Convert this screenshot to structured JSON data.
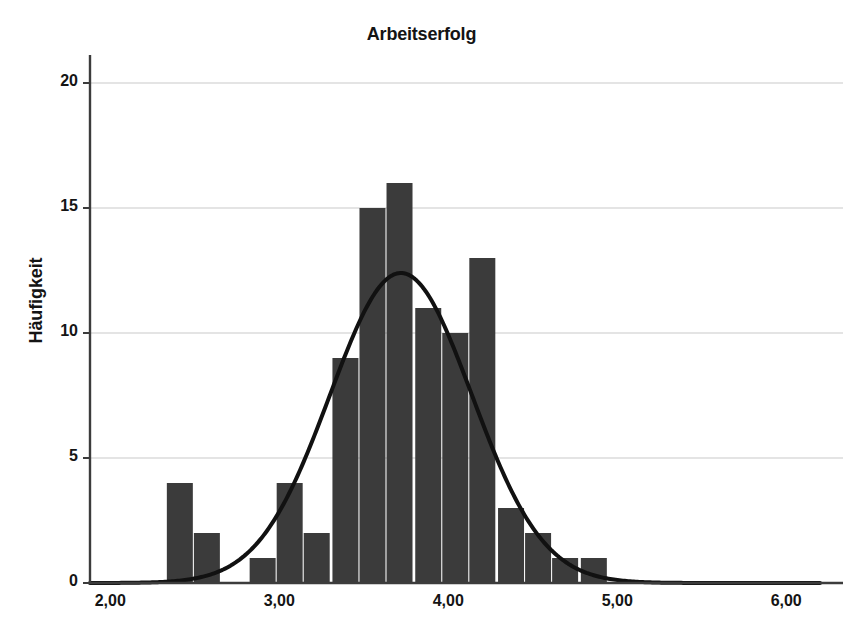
{
  "chart_data": {
    "type": "bar",
    "subtype": "histogram-with-normal-curve",
    "title": "Arbeitserfolg",
    "xlabel": "",
    "ylabel": "Häufigkeit",
    "xlim": [
      1.88,
      6.2
    ],
    "ylim": [
      0,
      20
    ],
    "grid": true,
    "grid_axis": "y",
    "legend": null,
    "xticks": [
      "2,00",
      "3,00",
      "4,00",
      "5,00",
      "6,00"
    ],
    "xtick_values": [
      2.0,
      3.0,
      4.0,
      5.0,
      6.0
    ],
    "yticks": [
      "0",
      "5",
      "10",
      "15",
      "20"
    ],
    "ytick_values": [
      0,
      5,
      10,
      15,
      20
    ],
    "bin_width": 0.1633,
    "bin_starts": [
      2.33,
      2.49,
      2.65,
      2.82,
      2.98,
      3.14,
      3.31,
      3.47,
      3.63,
      3.8,
      3.96,
      4.12,
      4.29,
      4.45,
      4.61,
      4.78
    ],
    "categories": [
      "2,33",
      "2,49",
      "2,65",
      "2,82",
      "2,98",
      "3,14",
      "3,31",
      "3,47",
      "3,63",
      "3,80",
      "3,96",
      "4,12",
      "4,29",
      "4,45",
      "4,61",
      "4,78"
    ],
    "values": [
      4,
      2,
      0,
      1,
      4,
      2,
      9,
      15,
      16,
      11,
      10,
      13,
      3,
      2,
      1,
      1
    ],
    "bar_color": "#3b3b3b",
    "curve": {
      "name": "Normalverteilungskurve",
      "color": "#111111",
      "mean": 3.72,
      "sigma": 0.42,
      "peak_value": 12.4,
      "line_width": 4
    },
    "annotations": []
  },
  "axes": {
    "y_axis_label": "Häufigkeit",
    "axis_color": "#3c3c3c",
    "gridline_color": "#c9c9c9"
  }
}
